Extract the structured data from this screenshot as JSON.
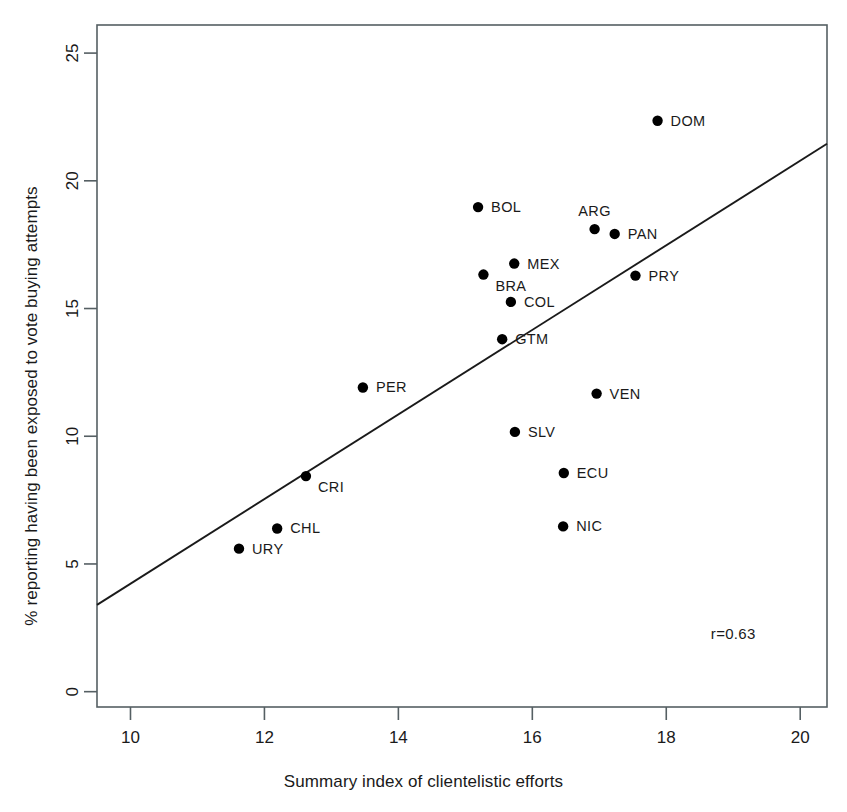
{
  "chart_data": {
    "type": "scatter",
    "title": "",
    "xlabel": "Summary index of clientelistic efforts",
    "ylabel": "% reporting having been exposed to vote buying attempts",
    "xlim": [
      9.5,
      20.4
    ],
    "ylim": [
      -0.6,
      26.1
    ],
    "xticks": [
      10,
      12,
      14,
      16,
      18,
      20
    ],
    "yticks": [
      0,
      5,
      10,
      15,
      20,
      25
    ],
    "xticklabels": [
      "10",
      "12",
      "14",
      "16",
      "18",
      "20"
    ],
    "yticklabels": [
      "0",
      "5",
      "10",
      "15",
      "20",
      "25"
    ],
    "grid": false,
    "legend": "none",
    "point_color": "#000000",
    "line_color": "#1a1a1a",
    "annotations": [
      {
        "text": "r=0.63",
        "x": 19.0,
        "y": 2.05
      }
    ],
    "fit_line": {
      "x_start": 9.5,
      "y_start": 3.4,
      "x_end": 20.4,
      "y_end": 21.45
    },
    "points": [
      {
        "label": "DOM",
        "x": 17.87,
        "y": 22.35,
        "label_pos": "right"
      },
      {
        "label": "BOL",
        "x": 15.19,
        "y": 18.97,
        "label_pos": "right"
      },
      {
        "label": "ARG",
        "x": 16.93,
        "y": 18.11,
        "label_pos": "above"
      },
      {
        "label": "PAN",
        "x": 17.23,
        "y": 17.92,
        "label_pos": "right"
      },
      {
        "label": "MEX",
        "x": 15.73,
        "y": 16.76,
        "label_pos": "right"
      },
      {
        "label": "BRA",
        "x": 15.27,
        "y": 16.33,
        "label_pos": "below-right"
      },
      {
        "label": "PRY",
        "x": 17.54,
        "y": 16.29,
        "label_pos": "right"
      },
      {
        "label": "COL",
        "x": 15.68,
        "y": 15.26,
        "label_pos": "right"
      },
      {
        "label": "GTM",
        "x": 15.55,
        "y": 13.8,
        "label_pos": "right"
      },
      {
        "label": "PER",
        "x": 13.47,
        "y": 11.91,
        "label_pos": "right"
      },
      {
        "label": "VEN",
        "x": 16.96,
        "y": 11.67,
        "label_pos": "right"
      },
      {
        "label": "SLV",
        "x": 15.74,
        "y": 10.17,
        "label_pos": "right"
      },
      {
        "label": "ECU",
        "x": 16.47,
        "y": 8.56,
        "label_pos": "right"
      },
      {
        "label": "CRI",
        "x": 12.62,
        "y": 8.44,
        "label_pos": "below-right"
      },
      {
        "label": "NIC",
        "x": 16.46,
        "y": 6.47,
        "label_pos": "right"
      },
      {
        "label": "CHL",
        "x": 12.19,
        "y": 6.39,
        "label_pos": "right"
      },
      {
        "label": "URY",
        "x": 11.62,
        "y": 5.6,
        "label_pos": "right"
      }
    ]
  }
}
